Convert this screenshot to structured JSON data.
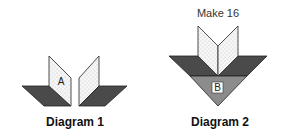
{
  "diagram1": {
    "caption": "Diagram 1",
    "panel_label": "A"
  },
  "diagram2": {
    "caption": "Diagram 2",
    "note": "Make 16",
    "center_label": "B"
  },
  "colors": {
    "dark_fabric": "#4a4a4a",
    "medium_fabric": "#8c8c8c",
    "light_fabric": "#f4f4f4",
    "outline": "#222222",
    "background": "#ffffff"
  }
}
